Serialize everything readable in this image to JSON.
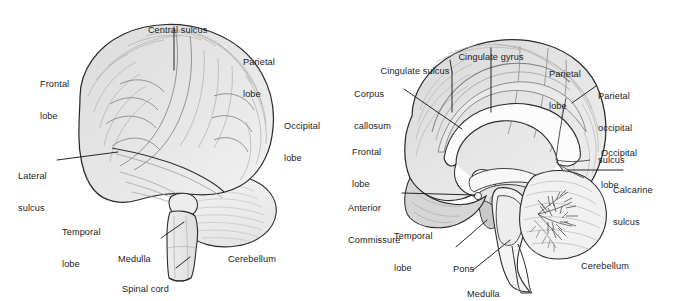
{
  "figure": {
    "background_color": "#ffffff",
    "ink_color": "#1b1b1b",
    "fills": {
      "cortex": "#e2e2e2",
      "cortex_shadow": "#cfcfcf",
      "cerebellum": "#eeeeee",
      "white_matter": "#fbfbfb",
      "brainstem": "#f0f0f0",
      "midbrain_gray": "#c8c8c8"
    }
  },
  "panels": [
    {
      "id": "lateral-view",
      "name": "Lateral view of the brain",
      "labels": [
        {
          "id": "central-sulcus",
          "text": "Central sulcus",
          "lines": [
            "Central sulcus"
          ]
        },
        {
          "id": "parietal-lobe",
          "text": "Parietal lobe",
          "lines": [
            "Parietal",
            "lobe"
          ]
        },
        {
          "id": "frontal-lobe",
          "text": "Frontal lobe",
          "lines": [
            "Frontal",
            "lobe"
          ]
        },
        {
          "id": "occipital-lobe",
          "text": "Occipital lobe",
          "lines": [
            "Occipital",
            "lobe"
          ]
        },
        {
          "id": "lateral-sulcus",
          "text": "Lateral sulcus",
          "lines": [
            "Lateral",
            "sulcus"
          ]
        },
        {
          "id": "temporal-lobe",
          "text": "Temporal lobe",
          "lines": [
            "Temporal",
            "lobe"
          ]
        },
        {
          "id": "medulla",
          "text": "Medulla",
          "lines": [
            "Medulla"
          ]
        },
        {
          "id": "spinal-cord",
          "text": "Spinal cord",
          "lines": [
            "Spinal cord"
          ]
        },
        {
          "id": "cerebellum",
          "text": "Cerebellum",
          "lines": [
            "Cerebellum"
          ]
        }
      ]
    },
    {
      "id": "midsagittal-view",
      "name": "Midsagittal view of the brain",
      "labels": [
        {
          "id": "cingulate-gyrus",
          "text": "Cingulate gyrus",
          "lines": [
            "Cingulate gyrus"
          ]
        },
        {
          "id": "cingulate-sulcus",
          "text": "Cingulate sulcus",
          "lines": [
            "Cingulate sulcus"
          ]
        },
        {
          "id": "corpus-callosum",
          "text": "Corpus callosum",
          "lines": [
            "Corpus",
            "callosum"
          ]
        },
        {
          "id": "parietal-lobe",
          "text": "Parietal lobe",
          "lines": [
            "Parietal",
            "lobe"
          ]
        },
        {
          "id": "parietal-occipital-sulcus",
          "text": "Parietal occipital sulcus",
          "lines": [
            "Parietal",
            "occipital",
            "sulcus"
          ]
        },
        {
          "id": "occipital-lobe",
          "text": "Occipital lobe",
          "lines": [
            "Occipital",
            "lobe"
          ]
        },
        {
          "id": "calcarine-sulcus",
          "text": "Calcarine sulcus",
          "lines": [
            "Calcarine",
            "sulcus"
          ]
        },
        {
          "id": "frontal-lobe",
          "text": "Frontal lobe",
          "lines": [
            "Frontal",
            "lobe"
          ]
        },
        {
          "id": "anterior-commissure",
          "text": "Anterior Commissure",
          "lines": [
            "Anterior",
            "Commissure"
          ]
        },
        {
          "id": "temporal-lobe",
          "text": "Temporal lobe",
          "lines": [
            "Temporal",
            "lobe"
          ]
        },
        {
          "id": "pons",
          "text": "Pons",
          "lines": [
            "Pons"
          ]
        },
        {
          "id": "medulla",
          "text": "Medulla",
          "lines": [
            "Medulla"
          ]
        },
        {
          "id": "cerebellum",
          "text": "Cerebellum",
          "lines": [
            "Cerebellum"
          ]
        }
      ]
    }
  ]
}
